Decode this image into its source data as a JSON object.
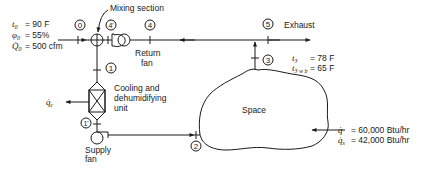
{
  "diagram": {
    "components": {
      "mixing_section": "Mixing section",
      "return_fan_line1": "Return",
      "return_fan_line2": "fan",
      "cooling_unit_line1": "Cooling and",
      "cooling_unit_line2": "dehumidifying",
      "cooling_unit_line3": "unit",
      "supply_fan_line1": "Supply",
      "supply_fan_line2": "fan",
      "space": "Space",
      "exhaust": "Exhaust"
    },
    "state_points": [
      "0",
      "4'",
      "4",
      "5",
      "3",
      "1",
      "1'",
      "2"
    ],
    "outdoor_conditions": {
      "t0_label": "t",
      "t0_sub": "0",
      "t0_value": "= 90 F",
      "phi0_label": "φ",
      "phi0_sub": "0",
      "phi0_value": "= 55%",
      "Q0_label": "Q̇",
      "Q0_sub": "0",
      "Q0_value": "= 500 cfm"
    },
    "space_conditions": {
      "t3_label": "t",
      "t3_sub": "3",
      "t3_value": "= 78 F",
      "t3wb_label": "t",
      "t3wb_sub": "3 w b",
      "t3wb_value": "= 65 F"
    },
    "loads": {
      "q_label": "q̇",
      "q_value": "= 60,000 Btu/hr",
      "qs_label": "q̇",
      "qs_sub": "s",
      "qs_value": "= 42,000 Btu/hr",
      "qc_label": "q̇",
      "qc_sub": "c"
    }
  }
}
